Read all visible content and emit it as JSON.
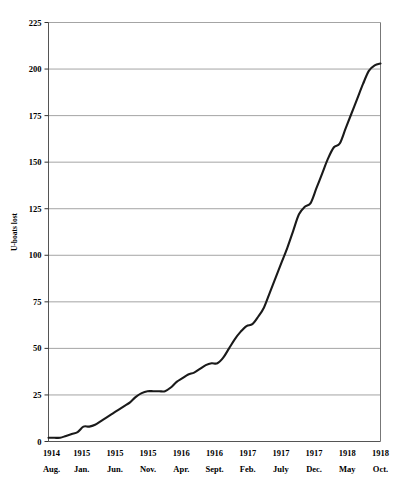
{
  "chart_data": {
    "type": "line",
    "title": "",
    "subtitle": "",
    "xlabel": "",
    "ylabel": "U-boats lost",
    "ylim": [
      0,
      225
    ],
    "ytick_values": [
      0,
      25,
      50,
      75,
      100,
      125,
      150,
      175,
      200,
      225
    ],
    "ytick_labels": [
      "0",
      "25",
      "50",
      "75",
      "100",
      "125",
      "150",
      "175",
      "200",
      "225"
    ],
    "grid": true,
    "grid_axis": "y",
    "legend": false,
    "legend_position": "none",
    "line_color": "#1a1a1a",
    "grid_color": "#9a9a9a",
    "axis_color": "#555555",
    "background_color": "#ffffff",
    "xtick_labels": [
      {
        "year": "1914",
        "month": "Aug."
      },
      {
        "year": "1915",
        "month": "Jan."
      },
      {
        "year": "1915",
        "month": "Jun."
      },
      {
        "year": "1915",
        "month": "Nov."
      },
      {
        "year": "1916",
        "month": "Apr."
      },
      {
        "year": "1916",
        "month": "Sept."
      },
      {
        "year": "1917",
        "month": "Feb."
      },
      {
        "year": "1917",
        "month": "July"
      },
      {
        "year": "1917",
        "month": "Dec."
      },
      {
        "year": "1918",
        "month": "May"
      },
      {
        "year": "1918",
        "month": "Oct."
      }
    ],
    "xtick_index": [
      0,
      5,
      10,
      15,
      20,
      25,
      30,
      35,
      40,
      45,
      50
    ],
    "x": [
      "1914 Aug.",
      "1914 Sept.",
      "1914 Oct.",
      "1914 Nov.",
      "1914 Dec.",
      "1915 Jan.",
      "1915 Feb.",
      "1915 Mar.",
      "1915 Apr.",
      "1915 May",
      "1915 Jun.",
      "1915 July",
      "1915 Aug.",
      "1915 Sept.",
      "1915 Oct.",
      "1915 Nov.",
      "1915 Dec.",
      "1916 Jan.",
      "1916 Feb.",
      "1916 Mar.",
      "1916 Apr.",
      "1916 May",
      "1916 Jun.",
      "1916 July",
      "1916 Aug.",
      "1916 Sept.",
      "1916 Oct.",
      "1916 Nov.",
      "1916 Dec.",
      "1917 Jan.",
      "1917 Feb.",
      "1917 Mar.",
      "1917 Apr.",
      "1917 May",
      "1917 Jun.",
      "1917 July",
      "1917 Aug.",
      "1917 Sept.",
      "1917 Oct.",
      "1917 Nov.",
      "1917 Dec.",
      "1918 Jan.",
      "1918 Feb.",
      "1918 Mar.",
      "1918 Apr.",
      "1918 May",
      "1918 Jun.",
      "1918 July",
      "1918 Aug.",
      "1918 Sept.",
      "1918 Oct.",
      "1918 Nov."
    ],
    "y": [
      2,
      2,
      2,
      3,
      3,
      4,
      5,
      7,
      8,
      8,
      9,
      11,
      13,
      15,
      17,
      19,
      21,
      23,
      25,
      26,
      26,
      26,
      26,
      26,
      27,
      29,
      32,
      34,
      36,
      36,
      38,
      40,
      42,
      42,
      44,
      47,
      50,
      53,
      57,
      61,
      62,
      65,
      70,
      75,
      80,
      86,
      93,
      99,
      108,
      117,
      126,
      128
    ],
    "series_note": "cumulative U-boats lost",
    "final_value": 203,
    "ymax_reached": 203
  },
  "curve_points": [
    {
      "i": 0,
      "v": 2
    },
    {
      "i": 1,
      "v": 2
    },
    {
      "i": 2,
      "v": 2
    },
    {
      "i": 3,
      "v": 3
    },
    {
      "i": 4,
      "v": 4
    },
    {
      "i": 5,
      "v": 5
    },
    {
      "i": 6,
      "v": 8
    },
    {
      "i": 7,
      "v": 8
    },
    {
      "i": 8,
      "v": 9
    },
    {
      "i": 9,
      "v": 11
    },
    {
      "i": 10,
      "v": 13
    },
    {
      "i": 11,
      "v": 15
    },
    {
      "i": 12,
      "v": 17
    },
    {
      "i": 13,
      "v": 19
    },
    {
      "i": 14,
      "v": 21
    },
    {
      "i": 15,
      "v": 24
    },
    {
      "i": 16,
      "v": 26
    },
    {
      "i": 17,
      "v": 27
    },
    {
      "i": 18,
      "v": 27
    },
    {
      "i": 19,
      "v": 27
    },
    {
      "i": 20,
      "v": 27
    },
    {
      "i": 21,
      "v": 29
    },
    {
      "i": 22,
      "v": 32
    },
    {
      "i": 23,
      "v": 34
    },
    {
      "i": 24,
      "v": 36
    },
    {
      "i": 25,
      "v": 37
    },
    {
      "i": 26,
      "v": 39
    },
    {
      "i": 27,
      "v": 41
    },
    {
      "i": 28,
      "v": 42
    },
    {
      "i": 29,
      "v": 42
    },
    {
      "i": 30,
      "v": 45
    },
    {
      "i": 31,
      "v": 50
    },
    {
      "i": 32,
      "v": 55
    },
    {
      "i": 33,
      "v": 59
    },
    {
      "i": 34,
      "v": 62
    },
    {
      "i": 35,
      "v": 63
    },
    {
      "i": 36,
      "v": 67
    },
    {
      "i": 37,
      "v": 72
    },
    {
      "i": 38,
      "v": 80
    },
    {
      "i": 39,
      "v": 88
    },
    {
      "i": 40,
      "v": 96
    },
    {
      "i": 41,
      "v": 104
    },
    {
      "i": 42,
      "v": 113
    },
    {
      "i": 43,
      "v": 122
    },
    {
      "i": 44,
      "v": 126
    },
    {
      "i": 45,
      "v": 128
    },
    {
      "i": 46,
      "v": 136
    },
    {
      "i": 47,
      "v": 144
    },
    {
      "i": 48,
      "v": 152
    },
    {
      "i": 49,
      "v": 158
    },
    {
      "i": 50,
      "v": 160
    },
    {
      "i": 51,
      "v": 168
    },
    {
      "i": 52,
      "v": 176
    },
    {
      "i": 53,
      "v": 184
    },
    {
      "i": 54,
      "v": 192
    },
    {
      "i": 55,
      "v": 199
    },
    {
      "i": 56,
      "v": 202
    },
    {
      "i": 57,
      "v": 203
    }
  ]
}
